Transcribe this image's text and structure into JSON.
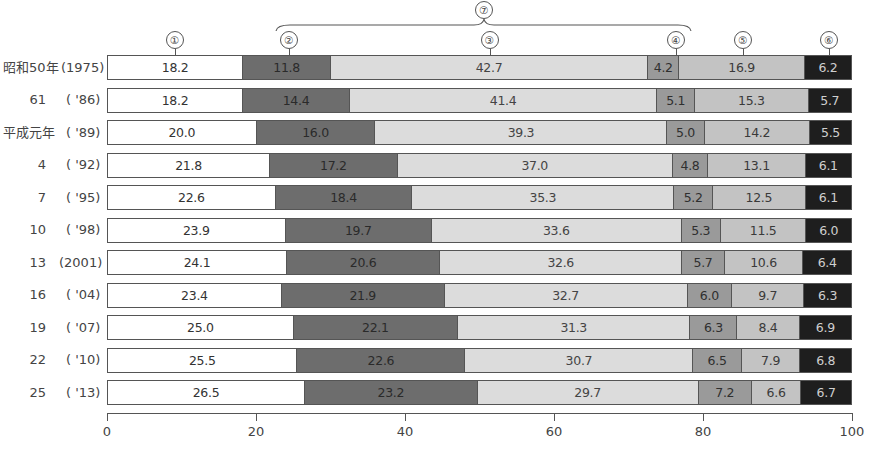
{
  "chart_data": {
    "type": "bar",
    "orientation": "horizontal",
    "stacked": true,
    "percent": true,
    "title": "",
    "xlabel": "",
    "ylabel": "",
    "xlim": [
      0,
      100
    ],
    "x_ticks": [
      "0",
      "20",
      "40",
      "60",
      "80",
      "100"
    ],
    "grid": false,
    "legend": "circled numbers above first bar",
    "segment_markers": [
      "①",
      "②",
      "③",
      "④",
      "⑤",
      "⑥"
    ],
    "group_marker": {
      "label": "⑦",
      "spans": [
        "②",
        "③",
        "④"
      ]
    },
    "categories": [
      {
        "era": "昭和50年",
        "year": "(1975)"
      },
      {
        "era": "61",
        "year": "( '86)"
      },
      {
        "era": "平成元年",
        "year": "( '89)"
      },
      {
        "era": "4",
        "year": "( '92)"
      },
      {
        "era": "7",
        "year": "( '95)"
      },
      {
        "era": "10",
        "year": "( '98)"
      },
      {
        "era": "13",
        "year": "(2001)"
      },
      {
        "era": "16",
        "year": "( '04)"
      },
      {
        "era": "19",
        "year": "( '07)"
      },
      {
        "era": "22",
        "year": "( '10)"
      },
      {
        "era": "25",
        "year": "( '13)"
      }
    ],
    "series": [
      {
        "name": "①",
        "color": "#ffffff",
        "values": [
          18.2,
          18.2,
          20.0,
          21.8,
          22.6,
          23.9,
          24.1,
          23.4,
          25.0,
          25.5,
          26.5
        ]
      },
      {
        "name": "②",
        "color": "#6d6d6d",
        "values": [
          11.8,
          14.4,
          16.0,
          17.2,
          18.4,
          19.7,
          20.6,
          21.9,
          22.1,
          22.6,
          23.2
        ]
      },
      {
        "name": "③",
        "color": "#dcdcdc",
        "values": [
          42.7,
          41.4,
          39.3,
          37.0,
          35.3,
          33.6,
          32.6,
          32.7,
          31.3,
          30.7,
          29.7
        ]
      },
      {
        "name": "④",
        "color": "#9a9a9a",
        "values": [
          4.2,
          5.1,
          5.0,
          4.8,
          5.2,
          5.3,
          5.7,
          6.0,
          6.3,
          6.5,
          7.2
        ]
      },
      {
        "name": "⑤",
        "color": "#c3c3c3",
        "values": [
          16.9,
          15.3,
          14.2,
          13.1,
          12.5,
          11.5,
          10.6,
          9.7,
          8.4,
          7.9,
          6.6
        ]
      },
      {
        "name": "⑥",
        "color": "#1e1e1e",
        "values": [
          6.2,
          5.7,
          5.5,
          6.1,
          6.1,
          6.0,
          6.4,
          6.3,
          6.9,
          6.8,
          6.7
        ]
      }
    ]
  }
}
